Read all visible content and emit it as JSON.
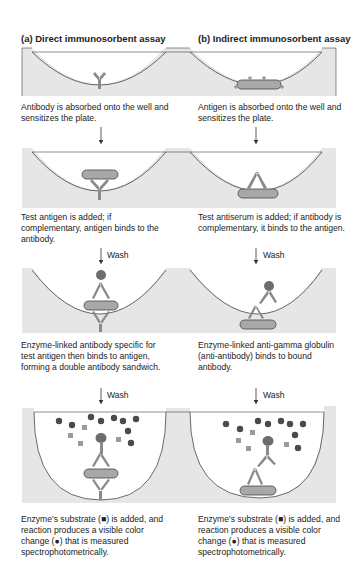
{
  "colors": {
    "well_fill": "#e6e6e6",
    "well_stroke": "#444444",
    "antibody": "#8a8a8a",
    "enzyme": "#6d6d6d",
    "antigen": "#a8a8a8",
    "product": "#4a4a4a",
    "substrate": "#9a9a9a"
  },
  "columns": [
    {
      "title": "(a) Direct immunosorbent assay",
      "steps": [
        {
          "caption": "Antibody is absorbed onto the well and sensitizes the plate."
        },
        {
          "caption": "Test antigen is added; if complementary, antigen binds to the antibody.",
          "arrow_label": "Wash"
        },
        {
          "caption": "Enzyme-linked antibody specific for test antigen then binds to antigen, forming a double antibody sandwich.",
          "arrow_label": "Wash"
        },
        {
          "caption": "Enzyme's substrate (■) is added, and reaction produces a visible color change (●) that is measured spectrophotometrically."
        }
      ]
    },
    {
      "title": "(b) Indirect immunosorbent assay",
      "steps": [
        {
          "caption": "Antigen is absorbed onto the well and sensitizes the plate."
        },
        {
          "caption": "Test antiserum is added; if antibody is complementary, it binds to the antigen.",
          "arrow_label": "Wash"
        },
        {
          "caption": "Enzyme-linked anti-gamma globulin (anti-antibody) binds to bound antibody.",
          "arrow_label": "Wash"
        },
        {
          "caption": "Enzyme's substrate (■) is added, and reaction produces a visible color change (●) that is measured spectrophotometrically."
        }
      ]
    }
  ]
}
